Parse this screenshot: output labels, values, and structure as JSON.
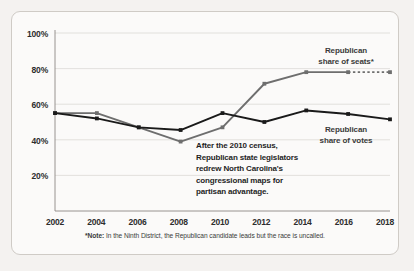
{
  "chart_data": {
    "type": "line",
    "title": "",
    "subtitle": "",
    "xlabel": "",
    "ylabel": "",
    "x": [
      2002,
      2004,
      2006,
      2008,
      2010,
      2012,
      2014,
      2016,
      2018
    ],
    "categories": [
      "2002",
      "2004",
      "2006",
      "2008",
      "2010",
      "2012",
      "2014",
      "2016",
      "2018"
    ],
    "ylim": [
      0,
      100
    ],
    "yticks": [
      20,
      40,
      60,
      80,
      100
    ],
    "ytick_labels": [
      "20%",
      "40%",
      "60%",
      "80%",
      "100%"
    ],
    "grid": true,
    "legend_position": "inline-right",
    "series": [
      {
        "name": "Republican share of seats*",
        "color": "#6e6e6e",
        "values": [
          55,
          55,
          47,
          39,
          47,
          71.5,
          78,
          78,
          78
        ],
        "dashed_from_index": 7,
        "label_lines": [
          "Republican",
          "share of seats*"
        ]
      },
      {
        "name": "Republican share of votes",
        "color": "#1a1a1a",
        "values": [
          55,
          52,
          47,
          45.5,
          55,
          50,
          56.5,
          54.5,
          51.5
        ],
        "dashed_from_index": null,
        "label_lines": [
          "Republican",
          "share of votes"
        ]
      }
    ],
    "annotations": [
      {
        "name": "census-annotation",
        "lines": [
          "After the 2010 census,",
          "Republican state legislators",
          "redrew North Carolina's",
          "congressional maps for",
          "partisan advantage."
        ]
      }
    ],
    "footnote": {
      "marker": "*Note:",
      "text": " In the Ninth District, the Republican candidate leads but the race is uncalled."
    }
  },
  "axis": {
    "ytick_labels": [
      "100%",
      "80%",
      "60%",
      "40%",
      "20%"
    ],
    "xtick_labels": [
      "2002",
      "2004",
      "2006",
      "2008",
      "2010",
      "2012",
      "2014",
      "2016",
      "2018"
    ]
  },
  "legend": {
    "seats_line1": "Republican",
    "seats_line2": "share of seats*",
    "votes_line1": "Republican",
    "votes_line2": "share of votes"
  },
  "annotation": {
    "line1": "After the 2010 census,",
    "line2": "Republican state legislators",
    "line3": "redrew North Carolina's",
    "line4": "congressional maps for",
    "line5": "partisan advantage."
  },
  "footnote": {
    "marker": "*Note:",
    "text": "In the Ninth District, the Republican candidate leads but the race is uncalled."
  },
  "colors": {
    "seats": "#6e6e6e",
    "votes": "#1a1a1a",
    "grid": "#dcd9d5",
    "axis": "#8c8884",
    "card_bg": "#fbfaf9",
    "page_bg": "#f4f2f0",
    "card_border": "#cfcbc6"
  }
}
